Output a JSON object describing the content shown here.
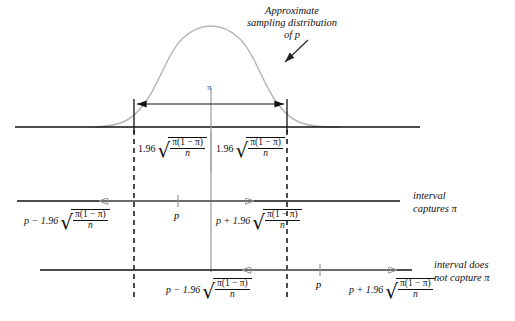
{
  "figure": {
    "type": "statistical-diagram",
    "topic": "confidence interval capture of population proportion",
    "annotation": {
      "line1": "Approximate",
      "line2": "sampling distribution",
      "line3": "of p"
    },
    "center_tick_label": "π",
    "margin_labels": {
      "left": {
        "coefficient": "1.96",
        "numerator": "π(1 − π)",
        "denominator": "n"
      },
      "right": {
        "coefficient": "1.96",
        "numerator": "π(1 − π)",
        "denominator": "n"
      }
    },
    "rows": [
      {
        "name": "captures",
        "center_label": "p",
        "lower_label": {
          "prefix": "p − 1.96",
          "numerator": "π(1 − π)",
          "denominator": "n"
        },
        "upper_label": {
          "prefix": "p + 1.96",
          "numerator": "π(1 − π)",
          "denominator": "n"
        },
        "result_line1": "interval",
        "result_line2": "captures π"
      },
      {
        "name": "does-not-capture",
        "center_label": "p",
        "lower_label": {
          "prefix": "p − 1.96",
          "numerator": "π(1 − π)",
          "denominator": "n"
        },
        "upper_label": {
          "prefix": "p + 1.96",
          "numerator": "π(1 − π)",
          "denominator": "n"
        },
        "result_line1": "interval does",
        "result_line2": "not capture π"
      }
    ],
    "colors": {
      "ink": "#111111",
      "curve": "#b3b3b3",
      "gray_rule": "#999999",
      "background": "#ffffff"
    }
  }
}
